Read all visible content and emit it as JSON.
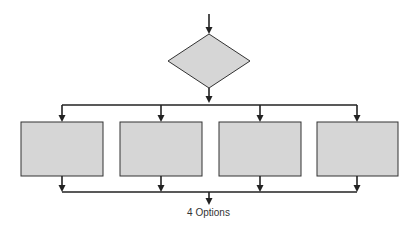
{
  "diagram": {
    "type": "flowchart",
    "caption": "4 Options",
    "colors": {
      "fill": "#d6d6d6",
      "stroke": "#333333",
      "line": "#222222"
    },
    "decision": {
      "shape": "diamond",
      "cx": 209,
      "cy": 61,
      "halfw": 41,
      "halfh": 27
    },
    "boxes": [
      {
        "x": 21,
        "y": 122,
        "w": 82,
        "h": 54
      },
      {
        "x": 120,
        "y": 122,
        "w": 82,
        "h": 54
      },
      {
        "x": 219,
        "y": 122,
        "w": 82,
        "h": 54
      },
      {
        "x": 317,
        "y": 122,
        "w": 81,
        "h": 54
      }
    ]
  }
}
